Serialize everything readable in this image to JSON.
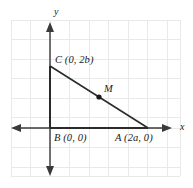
{
  "figure": {
    "background": "#ffffff",
    "grid": {
      "color": "#e9e9e9",
      "spacing": 19.5,
      "x_start": 11,
      "x_end": 180,
      "y_start": 20,
      "y_end": 176,
      "visible": true
    },
    "axes": {
      "color": "#3a3a3a",
      "origin_px": {
        "x": 50,
        "y": 128
      },
      "x_axis": {
        "label": "x",
        "from_px": 11,
        "to_px": 172,
        "arrows": "both"
      },
      "y_axis": {
        "label": "y",
        "from_px": 22,
        "to_px": 176,
        "arrows": "both"
      }
    },
    "labels": {
      "y_axis_label": "y",
      "x_axis_label": "x",
      "vertex_c": "C (0, 2b)",
      "vertex_b": "B (0, 0)",
      "vertex_a": "A (2a, 0)",
      "midpoint_m": "M"
    },
    "shape": {
      "type": "triangle",
      "stroke": "#2b2b2b",
      "fill": "none",
      "vertices": [
        {
          "name": "B",
          "label": "B (0, 0)",
          "coord": "(0, 0)",
          "px": {
            "x": 50,
            "y": 128
          }
        },
        {
          "name": "C",
          "label": "C (0, 2b)",
          "coord": "(0, 2b)",
          "px": {
            "x": 50,
            "y": 66
          }
        },
        {
          "name": "A",
          "label": "A (2a, 0)",
          "coord": "(2a, 0)",
          "px": {
            "x": 148,
            "y": 128
          }
        }
      ],
      "points": [
        {
          "name": "M",
          "label": "M",
          "on_segment": "CA",
          "px": {
            "x": 99,
            "y": 97
          },
          "marker": "filled-dot"
        }
      ]
    }
  }
}
